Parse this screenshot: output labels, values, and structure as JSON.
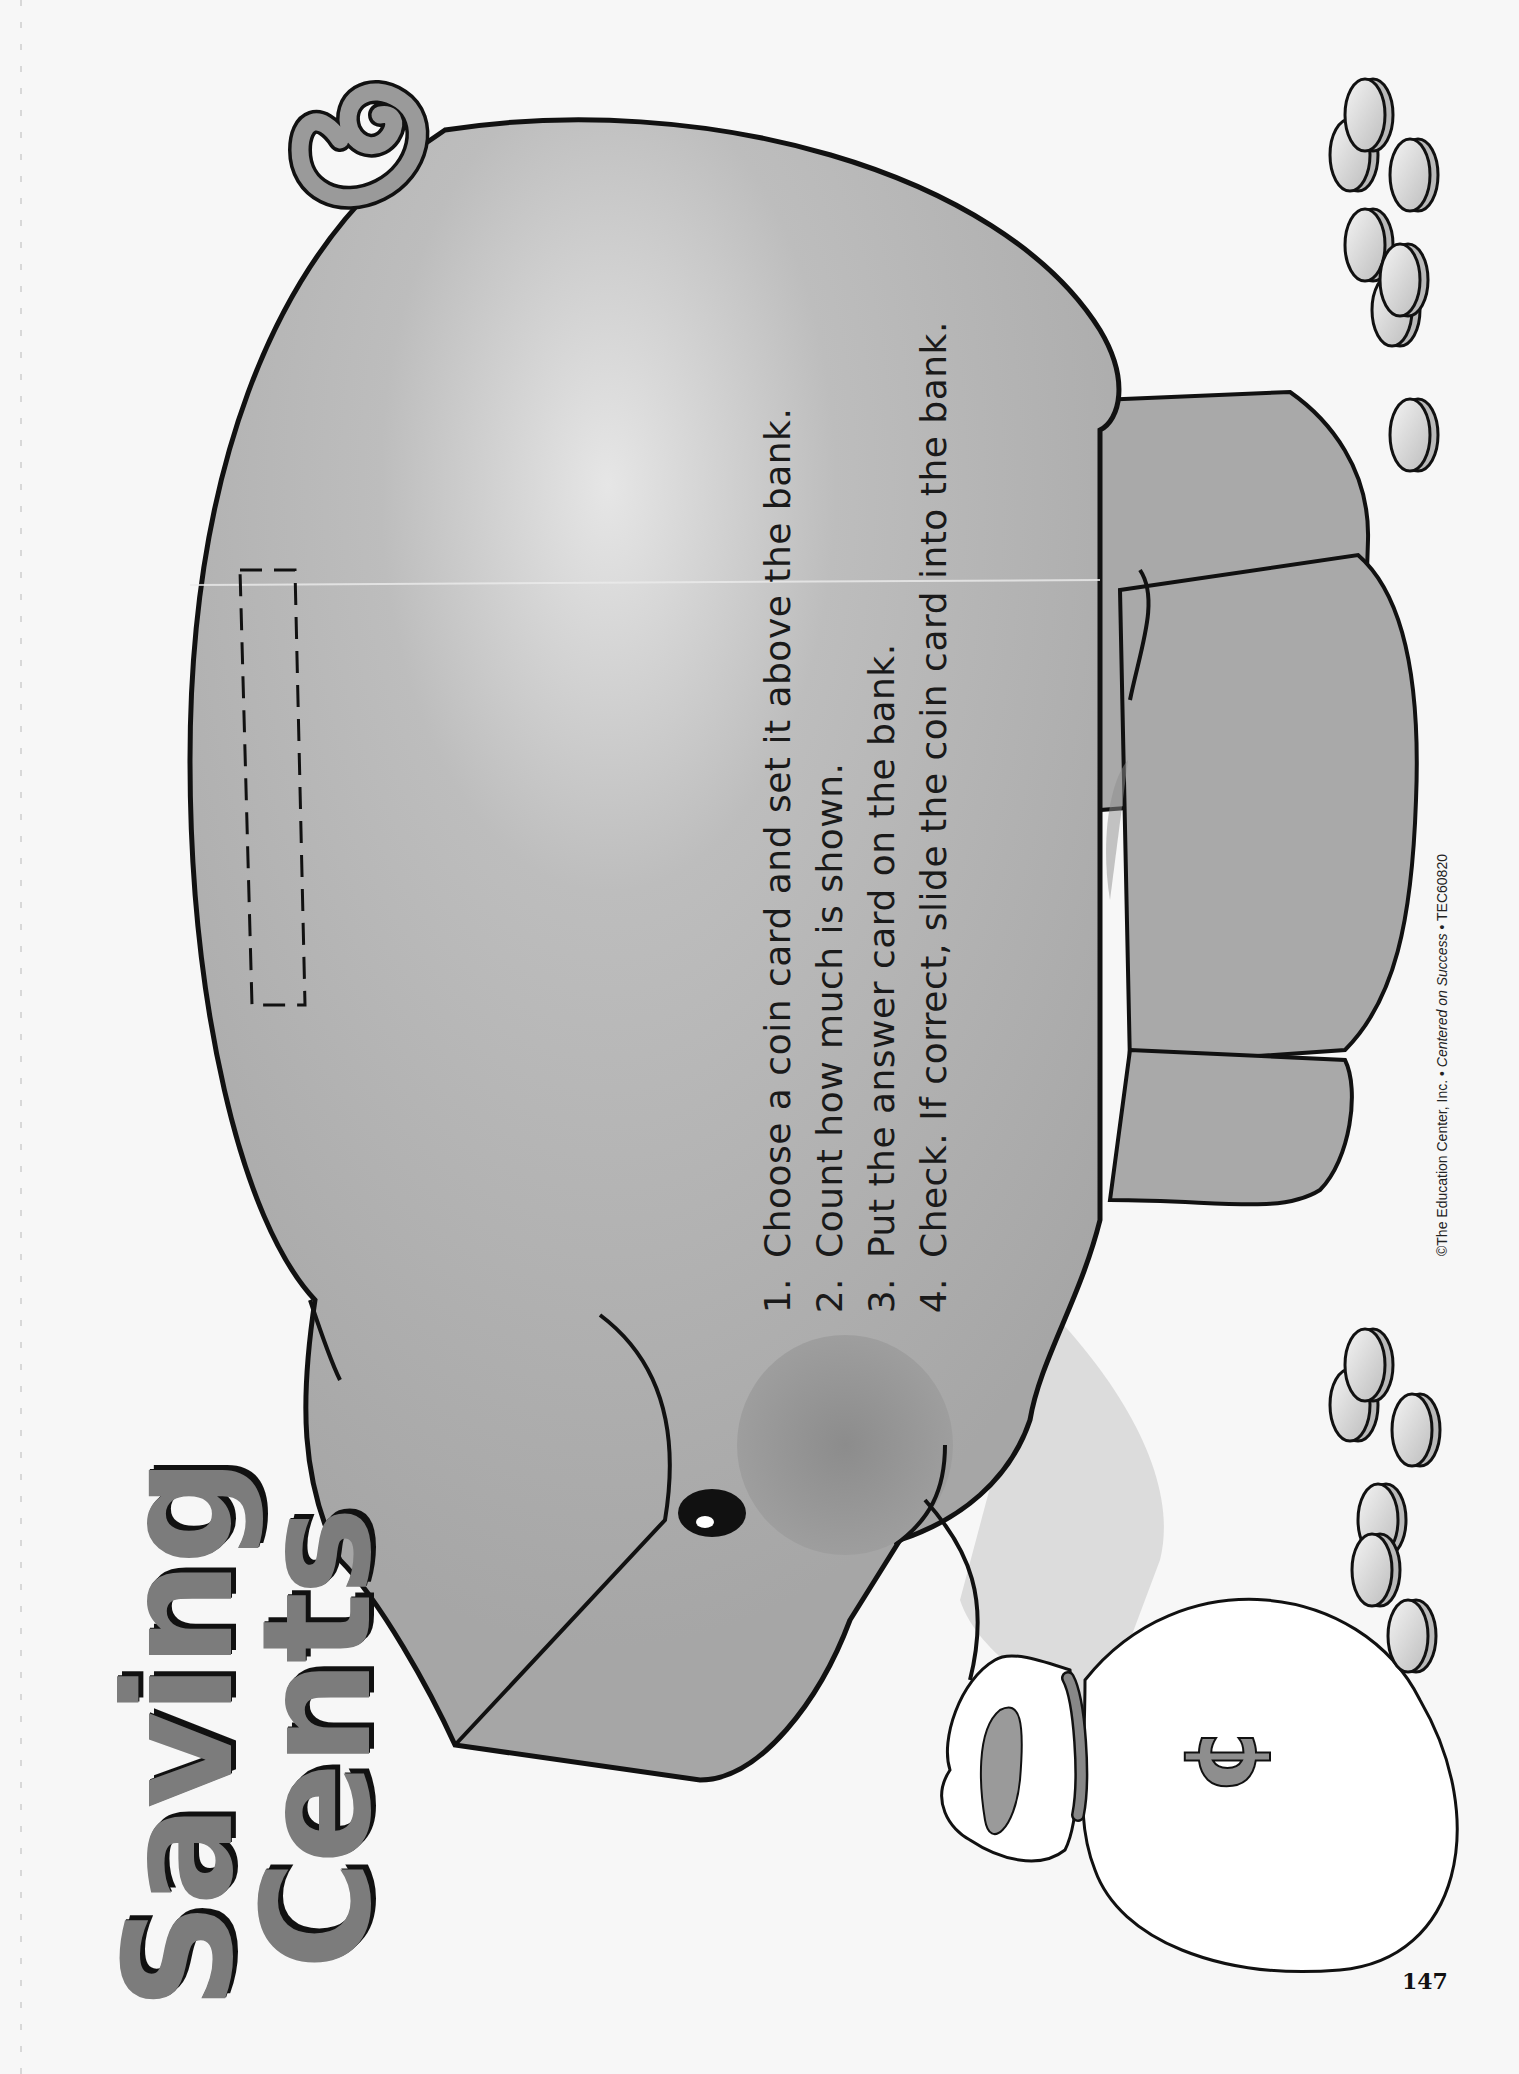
{
  "worksheet": {
    "title_line1": "Saving",
    "title_line2": "Cents",
    "instructions": [
      "Choose a coin card and set it above the bank.",
      "Count how much is shown.",
      "Put the answer card on the bank.",
      "Check. If correct, slide the coin card into the bank."
    ],
    "copyright_prefix": "©The Education Center, Inc. • ",
    "copyright_italic": "Centered on Success",
    "copyright_suffix": " • TEC60820",
    "page_number": "147"
  },
  "illustration": {
    "pig_color": "#a9a9a9",
    "pig_shade": "#8e8e8e",
    "outline_color": "#111111",
    "bag_color": "#ffffff",
    "cent_symbol": "¢",
    "coin_slot": "dashed cut-out slot",
    "coin_groups": 2
  }
}
